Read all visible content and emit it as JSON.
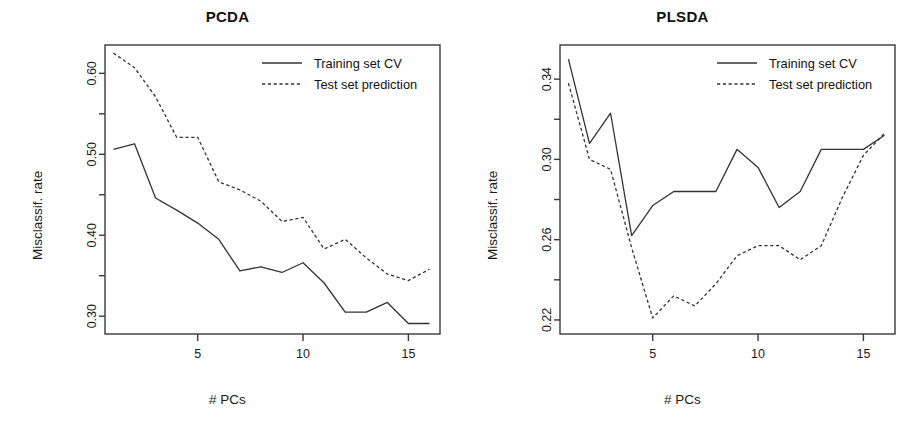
{
  "figure": {
    "background": "#ffffff",
    "line_color": "#333333",
    "axis_color": "#3a3a3a"
  },
  "panels": [
    {
      "id": "pcda",
      "title": "PCDA",
      "xlabel": "# PCs",
      "ylabel": "Misclassif. rate"
    },
    {
      "id": "plsda",
      "title": "PLSDA",
      "xlabel": "# PCs",
      "ylabel": "Misclassif. rate"
    }
  ],
  "legend": {
    "items": [
      {
        "label": "Training set CV",
        "style": "solid"
      },
      {
        "label": "Test set prediction",
        "style": "dashed"
      }
    ]
  },
  "chart_data": [
    {
      "type": "line",
      "title": "PCDA",
      "xlabel": "# PCs",
      "ylabel": "Misclassif. rate",
      "x": [
        1,
        2,
        3,
        4,
        5,
        6,
        7,
        8,
        9,
        10,
        11,
        12,
        13,
        14,
        15,
        16
      ],
      "xlim": [
        0.6,
        16.5
      ],
      "ylim": [
        0.278,
        0.635
      ],
      "xticks": [
        5,
        10,
        15
      ],
      "xtick_labels": [
        "5",
        "10",
        "15"
      ],
      "yticks": [
        0.3,
        0.35,
        0.4,
        0.45,
        0.5,
        0.55,
        0.6
      ],
      "ytick_labels": [
        "0.30",
        "",
        "0.40",
        "",
        "0.50",
        "",
        "0.60"
      ],
      "grid": false,
      "legend_position": "top-right",
      "series": [
        {
          "name": "Training set CV",
          "style": "solid",
          "values": [
            0.506,
            0.513,
            0.446,
            0.431,
            0.415,
            0.395,
            0.356,
            0.361,
            0.354,
            0.366,
            0.341,
            0.305,
            0.305,
            0.317,
            0.291,
            0.291
          ]
        },
        {
          "name": "Test set prediction",
          "style": "dashed",
          "values": [
            0.625,
            0.607,
            0.571,
            0.521,
            0.521,
            0.466,
            0.456,
            0.442,
            0.417,
            0.422,
            0.383,
            0.395,
            0.372,
            0.352,
            0.344,
            0.358,
            0.358
          ]
        }
      ]
    },
    {
      "type": "line",
      "title": "PLSDA",
      "xlabel": "# PCs",
      "ylabel": "Misclassif. rate",
      "x": [
        1,
        2,
        3,
        4,
        5,
        6,
        7,
        8,
        9,
        10,
        11,
        12,
        13,
        14,
        15,
        16
      ],
      "xlim": [
        0.6,
        16.5
      ],
      "ylim": [
        0.213,
        0.357
      ],
      "xticks": [
        5,
        10,
        15
      ],
      "xtick_labels": [
        "5",
        "10",
        "15"
      ],
      "yticks": [
        0.22,
        0.24,
        0.26,
        0.28,
        0.3,
        0.32,
        0.34
      ],
      "ytick_labels": [
        "0.22",
        "",
        "0.26",
        "",
        "0.30",
        "",
        "0.34"
      ],
      "grid": false,
      "legend_position": "top-right",
      "series": [
        {
          "name": "Training set CV",
          "style": "solid",
          "values": [
            0.35,
            0.308,
            0.323,
            0.262,
            0.277,
            0.284,
            0.284,
            0.284,
            0.305,
            0.296,
            0.276,
            0.284,
            0.305,
            0.305,
            0.305,
            0.312
          ]
        },
        {
          "name": "Test set prediction",
          "style": "dashed",
          "values": [
            0.338,
            0.3,
            0.295,
            0.256,
            0.221,
            0.232,
            0.227,
            0.238,
            0.252,
            0.257,
            0.257,
            0.25,
            0.257,
            0.281,
            0.302,
            0.313
          ]
        }
      ]
    }
  ]
}
